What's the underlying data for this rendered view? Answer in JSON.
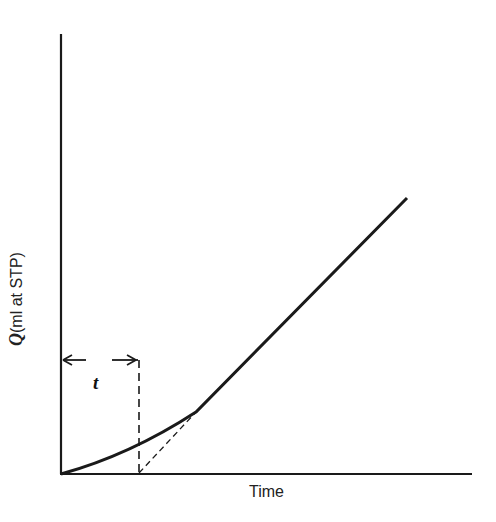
{
  "diagram": {
    "type": "line-plot-schematic",
    "x_axis_label": "Time",
    "y_axis_label_symbol": "Q",
    "y_axis_label_units": "(ml at STP)",
    "interval_label": "t"
  }
}
